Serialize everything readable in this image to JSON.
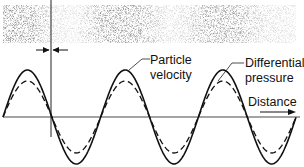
{
  "diagram": {
    "labels": {
      "particle_velocity_line1": "Particle",
      "particle_velocity_line2": "velocity",
      "differential_pressure_line1": "Differential",
      "differential_pressure_line2": "pressure",
      "distance": "Distance"
    },
    "colors": {
      "line": "#111111",
      "stipple": "#8a8a8a",
      "background": "#ffffff"
    },
    "waves": {
      "axis_y": 117,
      "x_start": 3,
      "x_end": 296,
      "period_px": 97.7,
      "particle_velocity": {
        "style": "solid",
        "amplitude_px": 47
      },
      "differential_pressure": {
        "style": "dashed",
        "amplitude_px": 36
      }
    },
    "band": {
      "y_top": 5,
      "y_bottom": 43,
      "x_left": 3,
      "x_right": 296
    },
    "marker": {
      "x": 51,
      "style": "vertical line with converging arrows"
    }
  }
}
